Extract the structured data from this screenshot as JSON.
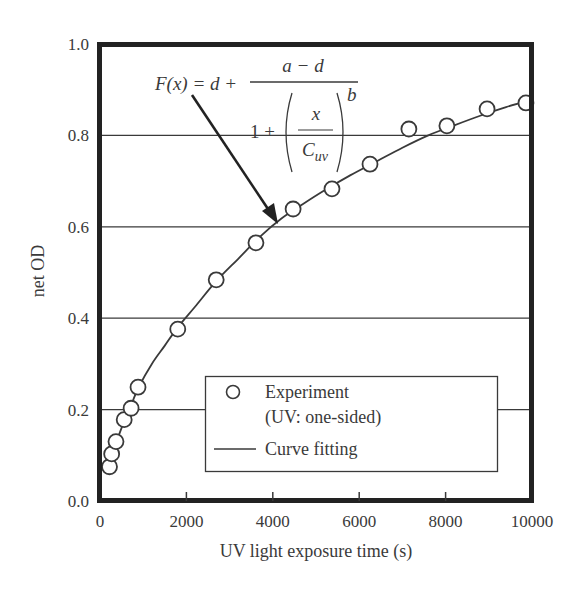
{
  "chart_data": {
    "type": "scatter",
    "title": "",
    "xlabel": "UV light exposure time (s)",
    "ylabel": "net OD",
    "xlim": [
      0,
      10000
    ],
    "ylim": [
      0.0,
      1.0
    ],
    "xticks": [
      0,
      2000,
      4000,
      6000,
      8000,
      10000
    ],
    "xtick_labels": [
      "0",
      "2000",
      "4000",
      "6000",
      "8000",
      "10000"
    ],
    "yticks": [
      0.0,
      0.2,
      0.4,
      0.6,
      0.8,
      1.0
    ],
    "ytick_labels": [
      "0.0",
      "0.2",
      "0.4",
      "0.6",
      "0.8",
      "1.0"
    ],
    "grid": {
      "horizontal": [
        0.2,
        0.4,
        0.6,
        0.8
      ],
      "vertical": false
    },
    "legend_position": "lower right (inside)",
    "series": [
      {
        "name": "Experiment (UV: one-sided)",
        "marker": "open-circle",
        "x": [
          220,
          270,
          370,
          560,
          720,
          880,
          1800,
          2690,
          3610,
          4470,
          5370,
          6250,
          7150,
          8030,
          8960,
          9860
        ],
        "y": [
          0.075,
          0.103,
          0.13,
          0.178,
          0.203,
          0.249,
          0.376,
          0.484,
          0.565,
          0.639,
          0.683,
          0.737,
          0.814,
          0.821,
          0.858,
          0.871
        ]
      },
      {
        "name": "Curve fitting",
        "marker": "line",
        "x": [
          180,
          250,
          350,
          500,
          700,
          900,
          1200,
          1500,
          1800,
          2200,
          2700,
          3200,
          3700,
          4200,
          4700,
          5200,
          5800,
          6400,
          7000,
          7600,
          8200,
          8800,
          9400,
          9900
        ],
        "y": [
          0.06,
          0.09,
          0.12,
          0.16,
          0.205,
          0.25,
          0.3,
          0.34,
          0.38,
          0.425,
          0.482,
          0.53,
          0.578,
          0.618,
          0.65,
          0.68,
          0.713,
          0.743,
          0.773,
          0.8,
          0.822,
          0.843,
          0.862,
          0.875
        ]
      }
    ],
    "annotations": [
      {
        "type": "arrow-with-formula",
        "text": "F(x) = d + (a − d) / (1 + (x / C_uv)^b)",
        "points_to": {
          "x": 4000,
          "y": 0.6
        }
      }
    ]
  },
  "axes": {
    "xlabel": "UV light exposure time (s)",
    "ylabel": "net OD"
  },
  "formula": {
    "lhs": "F(x) = d +",
    "numerator": "a − d",
    "denominator_prefix": "1 +",
    "inner_numerator": "x",
    "inner_denominator_base": "C",
    "inner_denominator_sub": "uv",
    "exponent": "b"
  },
  "legend": {
    "experiment_label_line1": "Experiment",
    "experiment_label_line2": "(UV: one-sided)",
    "curve_label": "Curve fitting"
  },
  "colors": {
    "ink": "#3a3a3a",
    "frame": "#222222",
    "background": "#ffffff"
  }
}
